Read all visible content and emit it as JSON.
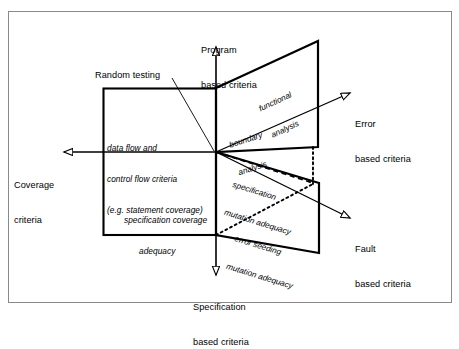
{
  "figure": {
    "kind": "axes-quadrant-diagram",
    "frame_border_color": "#8a8a8a",
    "line_color": "#000000",
    "background": "#ffffff"
  },
  "axes": [
    {
      "id": "program",
      "label_line1": "Program",
      "label_line2": "based criteria",
      "direction": "up"
    },
    {
      "id": "error",
      "label_line1": "Error",
      "label_line2": "based criteria",
      "direction": "up-right"
    },
    {
      "id": "fault",
      "label_line1": "Fault",
      "label_line2": "based criteria",
      "direction": "down-right"
    },
    {
      "id": "specification",
      "label_line1": "Specification",
      "label_line2": "based criteria",
      "direction": "down"
    },
    {
      "id": "coverage",
      "label_line1": "Coverage",
      "label_line2": "criteria",
      "direction": "left"
    }
  ],
  "callouts": [
    {
      "id": "random-testing",
      "text": "Random testing"
    }
  ],
  "quadrant_texts": [
    {
      "id": "data-flow-control-flow",
      "lines": [
        "data flow and",
        "control flow criteria",
        "(e.g. statement coverage)"
      ]
    },
    {
      "id": "specification-coverage-adequacy",
      "lines": [
        "specification coverage",
        "adequacy"
      ]
    }
  ],
  "diagonal_labels": [
    {
      "id": "functional-analysis",
      "lines": [
        "functional",
        "analysis"
      ],
      "style": "solid-region"
    },
    {
      "id": "boundary-analysis",
      "lines": [
        "boundary",
        "analysis"
      ],
      "style": "dashed-region"
    },
    {
      "id": "specification-mutation-adequacy",
      "lines": [
        "specification",
        "mutation adequacy"
      ],
      "style": "solid-region"
    },
    {
      "id": "error-seeding-mutation-adequacy",
      "lines": [
        "error seeding",
        "mutation adequacy"
      ],
      "style": "dotted-region"
    }
  ]
}
